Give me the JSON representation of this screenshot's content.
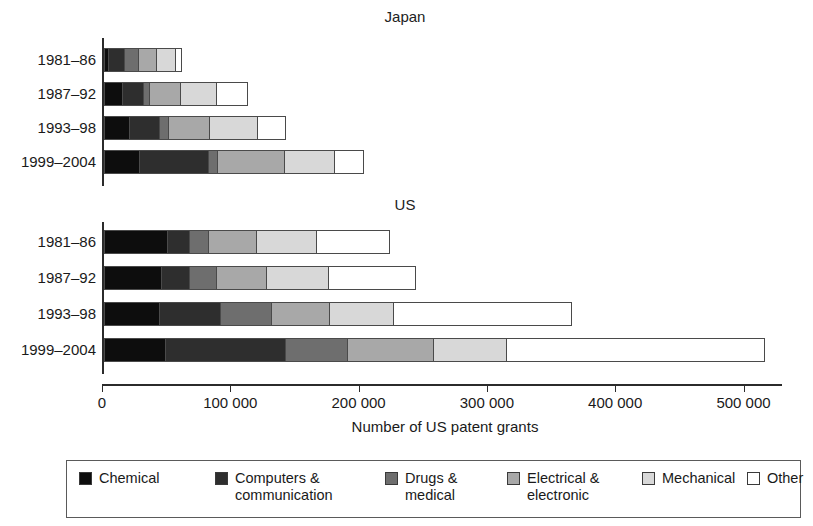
{
  "chart_data": {
    "type": "bar",
    "orientation": "horizontal",
    "stacked": true,
    "title": "",
    "xlabel": "Number of US patent grants",
    "ylabel": "",
    "xlim": [
      0,
      530000
    ],
    "xticks": [
      0,
      100000,
      200000,
      300000,
      400000,
      500000
    ],
    "xticklabels": [
      "0",
      "100 000",
      "200 000",
      "300 000",
      "400 000",
      "500 000"
    ],
    "grid": false,
    "legend_position": "bottom",
    "series": [
      {
        "name": "Chemical",
        "color": "#0d0d0d"
      },
      {
        "name": "Computers & communication",
        "color": "#2e2e2e"
      },
      {
        "name": "Drugs & medical",
        "color": "#6e6e6e"
      },
      {
        "name": "Electrical & electronic",
        "color": "#a8a8a8"
      },
      {
        "name": "Mechanical",
        "color": "#d8d8d8"
      },
      {
        "name": "Other",
        "color": "#ffffff"
      }
    ],
    "panels": [
      {
        "name": "Japan",
        "categories": [
          "1981–86",
          "1987–92",
          "1993–98",
          "1999–2004"
        ],
        "values": [
          [
            4000,
            12000,
            11000,
            14000,
            15000,
            5000
          ],
          [
            15000,
            16000,
            5000,
            24000,
            28000,
            24000
          ],
          [
            20000,
            24000,
            7000,
            32000,
            37000,
            22000
          ],
          [
            28000,
            54000,
            7000,
            52000,
            39000,
            23000
          ]
        ],
        "totals": [
          61000,
          112000,
          142000,
          203000
        ]
      },
      {
        "name": "US",
        "categories": [
          "1981–86",
          "1987–92",
          "1993–98",
          "1999–2004"
        ],
        "values": [
          [
            50000,
            17000,
            15000,
            37000,
            47000,
            57000
          ],
          [
            45000,
            22000,
            21000,
            39000,
            48000,
            68000
          ],
          [
            44000,
            47000,
            40000,
            45000,
            50000,
            139000
          ],
          [
            48000,
            94000,
            48000,
            67000,
            57000,
            201000
          ]
        ],
        "totals": [
          223000,
          283000,
          365000,
          515000
        ]
      }
    ]
  },
  "panels": {
    "japan": {
      "title": "Japan"
    },
    "us": {
      "title": "US"
    }
  },
  "axis": {
    "title": "Number of US patent grants",
    "tick_labels": [
      "0",
      "100 000",
      "200 000",
      "300 000",
      "400 000",
      "500 000"
    ]
  },
  "categories": {
    "japan": [
      "1981–86",
      "1987–92",
      "1993–98",
      "1999–2004"
    ],
    "us": [
      "1981–86",
      "1987–92",
      "1993–98",
      "1999–2004"
    ]
  },
  "legend": {
    "items": [
      {
        "label": "Chemical",
        "color": "#0d0d0d"
      },
      {
        "label": "Computers &\ncommunication",
        "color": "#2e2e2e"
      },
      {
        "label": "Drugs &\nmedical",
        "color": "#6e6e6e"
      },
      {
        "label": "Electrical &\nelectronic",
        "color": "#a8a8a8"
      },
      {
        "label": "Mechanical",
        "color": "#d8d8d8"
      },
      {
        "label": "Other",
        "color": "#ffffff"
      }
    ]
  }
}
